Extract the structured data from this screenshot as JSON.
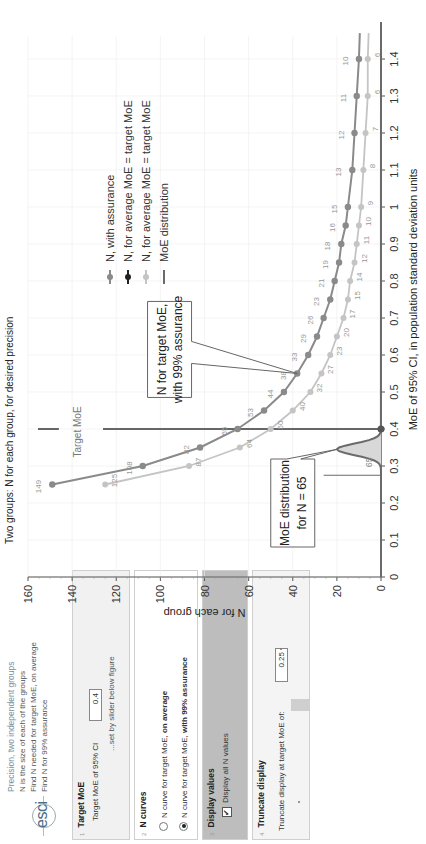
{
  "panel": {
    "logo": "esci",
    "intro": {
      "title": "Precision, two independent groups",
      "line1": "N is the size of each of the groups",
      "line2": "Find N needed for target MoE, on average",
      "line3": "Find N for 99% assurance"
    },
    "sections": [
      {
        "num": "1",
        "title": "Target MoE",
        "field_label": "Target MoE of 95% CI",
        "field_value": "0.4",
        "hint": "...set by slider below figure"
      },
      {
        "num": "2",
        "title": "N curves",
        "options": [
          {
            "label": "N curve for target MoE, ",
            "bold": "on average",
            "selected": false
          },
          {
            "label": "N curve for target MoE, ",
            "bold": "with 99% assurance",
            "selected": true
          }
        ]
      },
      {
        "num": "3",
        "title": "Display values",
        "checkbox_label": "Display all N values",
        "checked": true
      },
      {
        "num": "4",
        "title": "Truncate display",
        "field_label": "Truncate display at target MoE of:",
        "field_value": "0.25"
      }
    ]
  },
  "colors": {
    "assurance": "#8a8a8a",
    "average": "#c4c4c4",
    "target_line": "#666666",
    "moe_dist": "#6a6a6a",
    "moe_fill": "#d8d8d8",
    "grid": "#ececec",
    "axis": "#555555"
  },
  "chart_data": {
    "type": "line",
    "title": "Two groups: N for each group, for desired precision",
    "xlabel": "MoE of 95% CI, in population standard deviation units",
    "ylabel": "N for each group",
    "xlim": [
      0,
      1.5
    ],
    "ylim": [
      0,
      160
    ],
    "x_ticks": [
      "0",
      "0.1",
      "0.2",
      "0.3",
      "0.4",
      "0.5",
      "0.6",
      "0.7",
      "0.8",
      "0.9",
      "1",
      "1.1",
      "1.2",
      "1.3",
      "1.4"
    ],
    "y_ticks": [
      "0",
      "20",
      "40",
      "60",
      "80",
      "100",
      "120",
      "140",
      "160"
    ],
    "grid": true,
    "legend_position": "top-right",
    "legend": [
      "N, with assurance",
      "N, for average MoE = target MoE",
      "N, for average MoE = target MoE",
      "MoE distribution"
    ],
    "series": [
      {
        "name": "N, with assurance",
        "x": [
          0.25,
          0.3,
          0.35,
          0.4,
          0.45,
          0.5,
          0.55,
          0.6,
          0.65,
          0.7,
          0.75,
          0.8,
          0.85,
          0.9,
          0.95,
          1.0,
          1.1,
          1.2,
          1.3,
          1.4
        ],
        "values": [
          149,
          108,
          82,
          65,
          53,
          44,
          38,
          33,
          29,
          26,
          23,
          21,
          19,
          18,
          16,
          15,
          13,
          12,
          11,
          10
        ]
      },
      {
        "name": "N, for average MoE = target MoE",
        "x": [
          0.25,
          0.3,
          0.35,
          0.4,
          0.45,
          0.5,
          0.55,
          0.6,
          0.65,
          0.7,
          0.75,
          0.8,
          0.85,
          0.9,
          0.95,
          1.0,
          1.1,
          1.2,
          1.3,
          1.4
        ],
        "values": [
          125,
          87,
          64,
          50,
          40,
          32,
          27,
          23,
          20,
          17,
          15,
          14,
          12,
          11,
          10,
          9,
          8,
          7,
          6,
          6
        ]
      }
    ],
    "target_moe": 0.4,
    "moe_distribution": {
      "N": 65,
      "peak_x": 0.345,
      "range": [
        0.28,
        0.4
      ],
      "label": "65"
    },
    "annotations": [
      {
        "text": "Target MoE",
        "x": 0.4
      },
      {
        "text": "N for target MoE, with 99% assurance",
        "points_to": [
          0.55,
          38
        ]
      },
      {
        "text": "MoE distribution for N = 65",
        "points_to": [
          0.345,
          20
        ]
      }
    ]
  }
}
